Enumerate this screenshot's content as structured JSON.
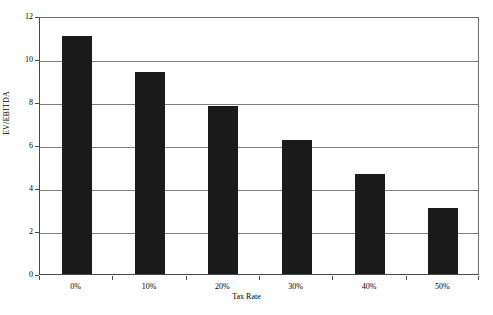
{
  "chart_data": {
    "type": "bar",
    "title": "",
    "subtitle": "",
    "xlabel": "Tax Rate",
    "ylabel": "EV/EBITDA",
    "categories": [
      "0%",
      "10%",
      "20%",
      "30%",
      "40%",
      "50%"
    ],
    "values": [
      11.05,
      9.4,
      7.8,
      6.25,
      4.65,
      3.05
    ],
    "ylim": [
      0,
      12
    ],
    "ytick_labels": [
      "0",
      "2",
      "4",
      "6",
      "8",
      "10",
      "12"
    ],
    "ytick_values": [
      0,
      2,
      4,
      6,
      8,
      10,
      12
    ],
    "grid": true,
    "legend": "none",
    "series": [
      {
        "name": "EV/EBITDA",
        "values": [
          11.05,
          9.4,
          7.8,
          6.25,
          4.65,
          3.05
        ],
        "color": "#1a1a1a"
      }
    ],
    "colors": {
      "bar": "#1a1a1a",
      "gridline": "#7d7d7d",
      "axis": "#4a4a4a",
      "plot_background": "#ffffff",
      "text": "#000000"
    }
  }
}
